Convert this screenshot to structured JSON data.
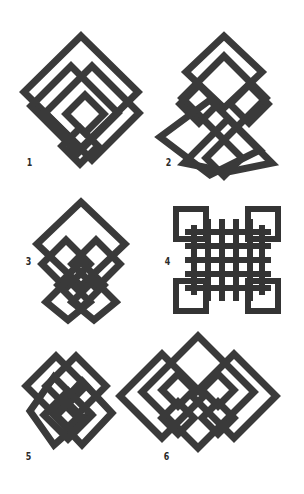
{
  "colors": {
    "background": "#ffffff",
    "stroke_dark": "#2e2e2e",
    "stroke_mid": "#4a4a4a",
    "stroke_light": "#5e5e5e",
    "label": "#2a2a2a"
  },
  "figures": [
    {
      "id": 1,
      "label": "1",
      "description": "interlaced rotated squares knot, diamond outline with nested square"
    },
    {
      "id": 2,
      "label": "2",
      "description": "vertically stacked interlaced diamond squares"
    },
    {
      "id": 3,
      "label": "3",
      "description": "large diamond over paired small diamonds, tapering downward"
    },
    {
      "id": 4,
      "label": "4",
      "description": "axis-aligned woven lattice knot with four corner loops"
    },
    {
      "id": 5,
      "label": "5",
      "description": "overlapping nested diamond squares"
    },
    {
      "id": 6,
      "label": "6",
      "description": "wide interlaced diamonds with central large diamond"
    }
  ]
}
